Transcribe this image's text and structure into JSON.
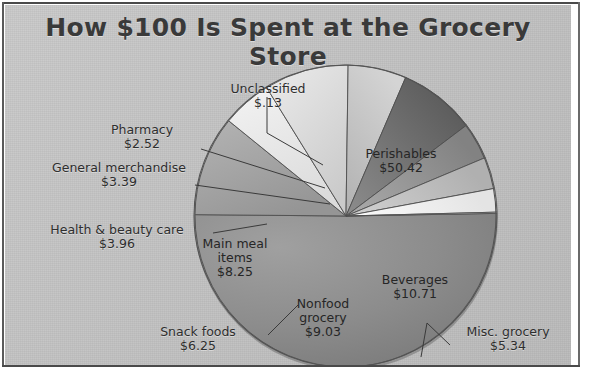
{
  "chart_data": {
    "type": "pie",
    "title": "How $100 Is Spent at the Grocery Store",
    "xlabel": "",
    "ylabel": "",
    "legend_position": "none",
    "grid": false,
    "value_prefix": "$",
    "total": 100.0,
    "categories": [
      "Perishables",
      "Beverages",
      "Misc. grocery",
      "Nonfood grocery",
      "Snack foods",
      "Main meal items",
      "Health & beauty care",
      "General merchandise",
      "Pharmacy",
      "Unclassified"
    ],
    "values": [
      50.42,
      10.71,
      5.34,
      9.03,
      6.25,
      8.25,
      3.96,
      3.39,
      2.52,
      0.13
    ],
    "slices": [
      {
        "label": "Perishables",
        "value": 50.42,
        "amount_text": "$50.42",
        "percent": 50.42,
        "start_deg": 0.0,
        "sweep_deg": 181.512,
        "fill": "#8e8e8e",
        "label_placement": "inside"
      },
      {
        "label": "Beverages",
        "value": 10.71,
        "amount_text": "$10.71",
        "percent": 10.71,
        "start_deg": 181.512,
        "sweep_deg": 38.556,
        "fill": "#a3a3a3",
        "label_placement": "inside"
      },
      {
        "label": "Misc. grocery",
        "value": 5.34,
        "amount_text": "$5.34",
        "percent": 5.34,
        "start_deg": 220.068,
        "sweep_deg": 19.224,
        "fill": "#e9e9e9",
        "label_placement": "outside"
      },
      {
        "label": "Nonfood grocery",
        "value": 9.03,
        "amount_text": "$9.03",
        "percent": 9.03,
        "start_deg": 239.292,
        "sweep_deg": 32.508,
        "fill": "#dcdcdc",
        "label_placement": "inside"
      },
      {
        "label": "Snack foods",
        "value": 6.25,
        "amount_text": "$6.25",
        "percent": 6.25,
        "start_deg": 271.8,
        "sweep_deg": 22.5,
        "fill": "#c6c6c6",
        "label_placement": "outside"
      },
      {
        "label": "Main meal items",
        "value": 8.25,
        "amount_text": "$8.25",
        "percent": 8.25,
        "start_deg": 294.3,
        "sweep_deg": 29.7,
        "fill": "#6f6f6f",
        "label_placement": "inside"
      },
      {
        "label": "Health & beauty care",
        "value": 3.96,
        "amount_text": "$3.96",
        "percent": 3.96,
        "start_deg": 324.0,
        "sweep_deg": 14.256,
        "fill": "#909090",
        "label_placement": "outside"
      },
      {
        "label": "General merchandise",
        "value": 3.39,
        "amount_text": "$3.39",
        "percent": 3.39,
        "start_deg": 338.256,
        "sweep_deg": 12.204,
        "fill": "#bcbcbc",
        "label_placement": "outside"
      },
      {
        "label": "Pharmacy",
        "value": 2.52,
        "amount_text": "$2.52",
        "percent": 2.52,
        "start_deg": 350.46,
        "sweep_deg": 9.072,
        "fill": "#efefef",
        "label_placement": "outside"
      },
      {
        "label": "Unclassified",
        "value": 0.13,
        "amount_text": "$.13",
        "percent": 0.13,
        "start_deg": 359.532,
        "sweep_deg": 0.468,
        "fill": "#f7f7f7",
        "label_placement": "outside"
      }
    ]
  },
  "title": {
    "text": "How $100 Is Spent at the Grocery Store"
  },
  "labels": {
    "unclassified": {
      "name": "Unclassified",
      "amount": "$.13"
    },
    "pharmacy": {
      "name": "Pharmacy",
      "amount": "$2.52"
    },
    "general_merchandise": {
      "name": "General merchandise",
      "amount": "$3.39"
    },
    "health_beauty": {
      "name": "Health & beauty care",
      "amount": "$3.96"
    },
    "snack_foods": {
      "name": "Snack foods",
      "amount": "$6.25"
    },
    "main_meal": {
      "name": "Main meal",
      "name2": "items",
      "amount": "$8.25"
    },
    "nonfood": {
      "name": "Nonfood",
      "name2": "grocery",
      "amount": "$9.03"
    },
    "misc_grocery": {
      "name": "Misc. grocery",
      "amount": "$5.34"
    },
    "beverages": {
      "name": "Beverages",
      "amount": "$10.71"
    },
    "perishables": {
      "name": "Perishables",
      "amount": "$50.42"
    }
  },
  "colors": {
    "panel_background": "#c3c3c3",
    "frame_rule": "#4a4a4a",
    "page_background": "#ffffff",
    "text": "#2e2e2e",
    "pie_shadow": "#8a8a8a"
  }
}
